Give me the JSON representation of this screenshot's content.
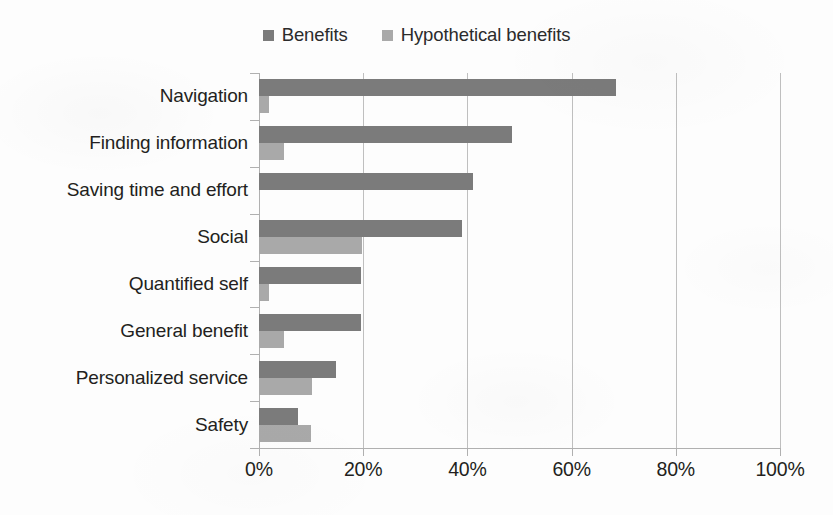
{
  "chart_data": {
    "type": "bar",
    "orientation": "horizontal",
    "title": "",
    "xlabel": "",
    "ylabel": "",
    "xlim": [
      0,
      100
    ],
    "xticks": [
      0,
      20,
      40,
      60,
      80,
      100
    ],
    "xticklabels": [
      "0%",
      "20%",
      "40%",
      "60%",
      "80%",
      "100%"
    ],
    "grid": "vertical",
    "legend_position": "top-center",
    "categories": [
      "Navigation",
      "Finding information",
      "Saving time and effort",
      "Social",
      "Quantified self",
      "General benefit",
      "Personalized service",
      "Safety"
    ],
    "series": [
      {
        "name": "Benefits",
        "color": "#7b7b7b",
        "values": [
          68.5,
          48.5,
          41,
          39,
          19.6,
          19.6,
          14.8,
          7.5
        ]
      },
      {
        "name": "Hypothetical benefits",
        "color": "#a9a9a9",
        "values": [
          2,
          4.8,
          0,
          19.8,
          2,
          4.8,
          10.2,
          10
        ]
      }
    ]
  },
  "legend": {
    "items": [
      {
        "label": "Benefits",
        "color": "#7b7b7b"
      },
      {
        "label": "Hypothetical benefits",
        "color": "#a9a9a9"
      }
    ]
  }
}
